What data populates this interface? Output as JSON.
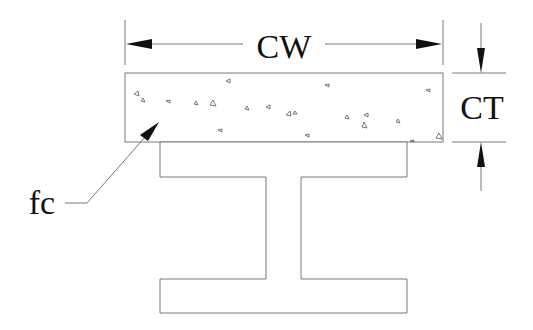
{
  "diagram": {
    "labels": {
      "concrete_width": "CW",
      "concrete_thickness": "CT",
      "concrete_strength": "fc"
    },
    "colors": {
      "line": "#7a7a7a",
      "arrow": "#111111",
      "text": "#111111",
      "background": "#ffffff"
    },
    "components": [
      {
        "name": "concrete-slab",
        "shape": "rectangle",
        "fill": "speckled aggregate"
      },
      {
        "name": "steel-i-beam",
        "shape": "I-section"
      }
    ]
  }
}
